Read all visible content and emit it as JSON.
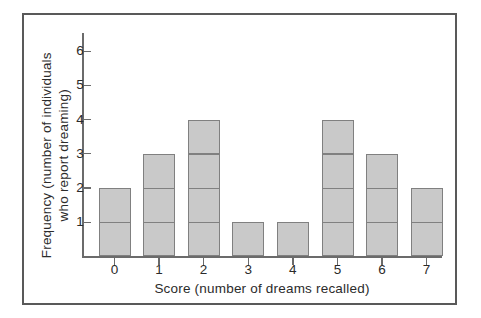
{
  "figure": {
    "background_color": "#ffffff",
    "frame_color": "#595959"
  },
  "chart_data": {
    "type": "bar",
    "title": "",
    "subtitle": "",
    "xlabel": "Score (number of dreams recalled)",
    "ylabel": "Frequency (number of individuals who report dreaming)",
    "ylabel_line1": "Frequency (number of individuals",
    "ylabel_line2": "who report dreaming)",
    "categories": [
      "0",
      "1",
      "2",
      "3",
      "4",
      "5",
      "6",
      "7"
    ],
    "values": [
      2,
      3,
      4,
      1,
      1,
      4,
      3,
      2
    ],
    "x_tick_labels": [
      "0",
      "1",
      "2",
      "3",
      "4",
      "5",
      "6",
      "7"
    ],
    "y_tick_labels": [
      "1",
      "2",
      "3",
      "4",
      "5",
      "6"
    ],
    "y_tick_values": [
      1,
      2,
      3,
      4,
      5,
      6
    ],
    "xlim": [
      -0.5,
      7.5
    ],
    "ylim": [
      0,
      6.6
    ],
    "grid": false,
    "legend": null,
    "bar_fill_color": "#c9c9c9",
    "bar_edge_color": "#808080",
    "axis_color": "#6b6b6b",
    "text_color": "#2b2b2b",
    "unit_segment_lines": true,
    "total_count": 20,
    "annotations": []
  }
}
